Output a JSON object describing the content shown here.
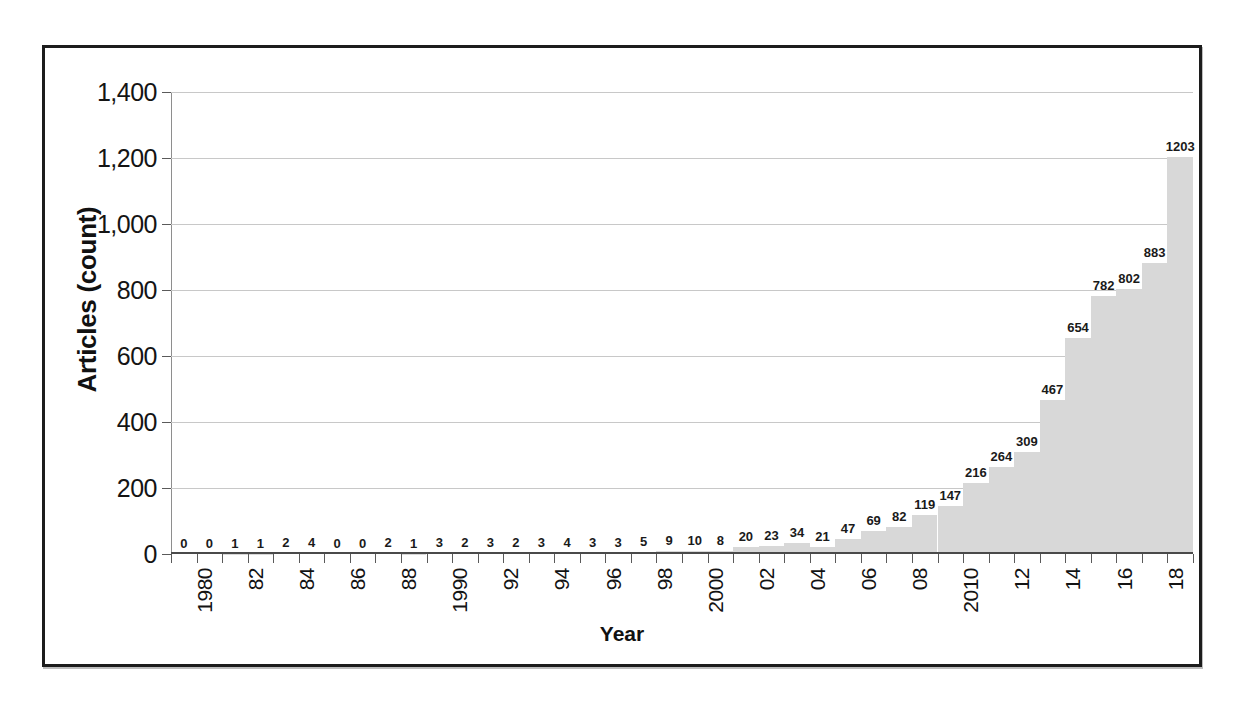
{
  "chart_data": {
    "type": "bar",
    "title": "",
    "xlabel": "Year",
    "ylabel": "Articles (count)",
    "ylim": [
      0,
      1400
    ],
    "ytick_values": [
      0,
      200,
      400,
      600,
      800,
      1000,
      1200,
      1400
    ],
    "ytick_labels": [
      "0",
      "200",
      "400",
      "600",
      "800",
      "1,000",
      "1,200",
      "1,400"
    ],
    "grid": true,
    "legend": "none",
    "bar_color": "#d8d8d8",
    "categories": [
      "1980",
      "1981",
      "1982",
      "1983",
      "1984",
      "1985",
      "1986",
      "1987",
      "1988",
      "1989",
      "1990",
      "1991",
      "1992",
      "1993",
      "1994",
      "1995",
      "1996",
      "1997",
      "1998",
      "1999",
      "2000",
      "2001",
      "2002",
      "2003",
      "2004",
      "2005",
      "2006",
      "2007",
      "2008",
      "2009",
      "2010",
      "2011",
      "2012",
      "2013",
      "2014",
      "2015",
      "2016",
      "2017",
      "2018",
      "2019"
    ],
    "values": [
      0,
      0,
      1,
      1,
      2,
      4,
      0,
      0,
      2,
      1,
      3,
      2,
      3,
      2,
      3,
      4,
      3,
      3,
      5,
      9,
      10,
      8,
      20,
      23,
      34,
      21,
      47,
      69,
      82,
      119,
      147,
      216,
      264,
      309,
      467,
      654,
      782,
      802,
      883,
      1203
    ],
    "data_labels": [
      "0",
      "0",
      "1",
      "1",
      "2",
      "4",
      "0",
      "0",
      "2",
      "1",
      "3",
      "2",
      "3",
      "2",
      "3",
      "4",
      "3",
      "3",
      "5",
      "9",
      "10",
      "8",
      "20",
      "23",
      "34",
      "21",
      "47",
      "69",
      "82",
      "119",
      "147",
      "216",
      "264",
      "309",
      "467",
      "654",
      "782",
      "802",
      "883",
      "1203"
    ],
    "xtick_labels": [
      "1980",
      "82",
      "84",
      "86",
      "88",
      "1990",
      "92",
      "94",
      "96",
      "98",
      "2000",
      "02",
      "04",
      "06",
      "08",
      "2010",
      "12",
      "14",
      "16",
      "18"
    ],
    "xtick_index": [
      0,
      2,
      4,
      6,
      8,
      10,
      12,
      14,
      16,
      18,
      20,
      22,
      24,
      26,
      28,
      30,
      32,
      34,
      36,
      38
    ]
  }
}
